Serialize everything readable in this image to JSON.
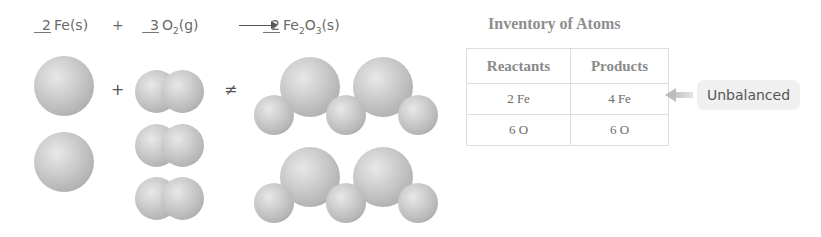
{
  "equation": {
    "reactant1": {
      "coefficient": "2",
      "formula": "Fe",
      "state": "(s)"
    },
    "plus": "+",
    "reactant2": {
      "coefficient": "3",
      "formula": "O",
      "subscript": "2",
      "state": "(g)"
    },
    "product": {
      "coefficient": "2",
      "formula_parts": [
        "Fe",
        "2",
        "O",
        "3"
      ],
      "state": "(s)"
    }
  },
  "diagram": {
    "plus_symbol": "+",
    "not_equal_symbol": "≠",
    "reactant_fe_atoms": 2,
    "reactant_o2_molecules": 3,
    "product_fe2o3_molecules": 2
  },
  "inventory": {
    "title": "Inventory of Atoms",
    "headers": [
      "Reactants",
      "Products"
    ],
    "rows": [
      [
        "2 Fe",
        "4 Fe"
      ],
      [
        "6 O",
        "6 O"
      ]
    ],
    "status_label": "Unbalanced",
    "status_row": 0
  },
  "colors": {
    "atom_gray": "#c0c0c0",
    "badge_bg": "#f0f0f0",
    "arrow_gray": "#c4c4c4"
  }
}
